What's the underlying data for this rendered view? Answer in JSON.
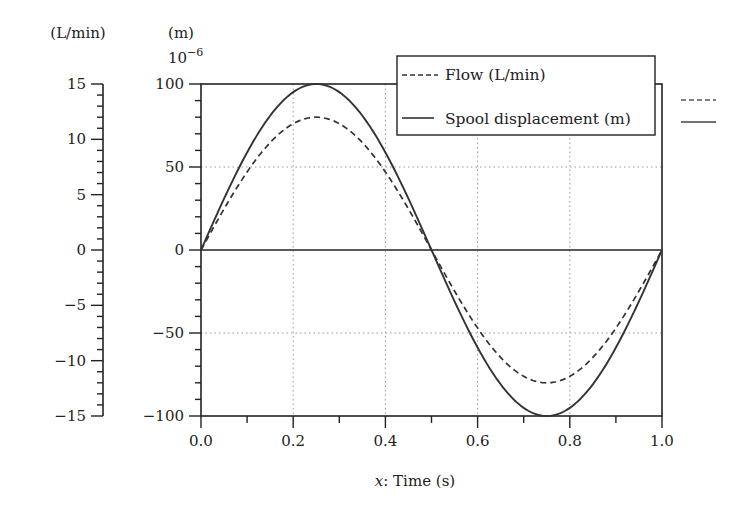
{
  "chart_data": {
    "type": "line",
    "title": "",
    "xlabel_prefix": "x",
    "xlabel": "x: Time (s)",
    "xlabel_rest": ": Time (s)",
    "xlim": [
      0.0,
      1.0
    ],
    "xticks": [
      "0.0",
      "0.2",
      "0.4",
      "0.6",
      "0.8",
      "1.0"
    ],
    "y_left_outer": {
      "unit_label": "(L/min)",
      "ylim": [
        -15,
        15
      ],
      "ticks": [
        "15",
        "10",
        "5",
        "0",
        "−5",
        "−10",
        "−15"
      ],
      "tick_values": [
        15,
        10,
        5,
        0,
        -5,
        -10,
        -15
      ]
    },
    "y_left_inner": {
      "unit_label": "(m)",
      "multiplier": "10",
      "multiplier_exp": "−6",
      "ylim": [
        -100,
        100
      ],
      "ticks": [
        "100",
        "50",
        "0",
        "−50",
        "−100"
      ],
      "tick_values": [
        100,
        50,
        0,
        -50,
        -100
      ]
    },
    "grid": "dotted",
    "legend_position": "upper right",
    "series": [
      {
        "name": "Flow (L/min)",
        "style": "dashed",
        "axis": "L/min",
        "amplitude": 12,
        "x": [
          0.0,
          0.05,
          0.1,
          0.15,
          0.2,
          0.25,
          0.3,
          0.35,
          0.4,
          0.45,
          0.5,
          0.55,
          0.6,
          0.65,
          0.7,
          0.75,
          0.8,
          0.85,
          0.9,
          0.95,
          1.0
        ],
        "values": [
          0.0,
          3.7,
          7.1,
          9.7,
          11.4,
          12.0,
          11.4,
          9.7,
          7.1,
          3.7,
          0.0,
          -3.7,
          -7.1,
          -9.7,
          -11.4,
          -12.0,
          -11.4,
          -9.7,
          -7.1,
          -3.7,
          0.0
        ]
      },
      {
        "name": "Spool displacement (m)",
        "style": "solid",
        "axis": "m (×10⁻⁶)",
        "amplitude": 100,
        "x": [
          0.0,
          0.05,
          0.1,
          0.15,
          0.2,
          0.25,
          0.3,
          0.35,
          0.4,
          0.45,
          0.5,
          0.55,
          0.6,
          0.65,
          0.7,
          0.75,
          0.8,
          0.85,
          0.9,
          0.95,
          1.0
        ],
        "values": [
          0.0,
          30.9,
          58.8,
          80.9,
          95.1,
          100.0,
          95.1,
          80.9,
          58.8,
          30.9,
          0.0,
          -30.9,
          -58.8,
          -80.9,
          -95.1,
          -100.0,
          -95.1,
          -80.9,
          -58.8,
          -30.9,
          0.0
        ]
      }
    ],
    "legend": [
      "Flow (L/min)",
      "Spool displacement (m)"
    ],
    "colors": {
      "line": "#333333",
      "grid": "#9a9a9a",
      "axis": "#222222"
    }
  }
}
